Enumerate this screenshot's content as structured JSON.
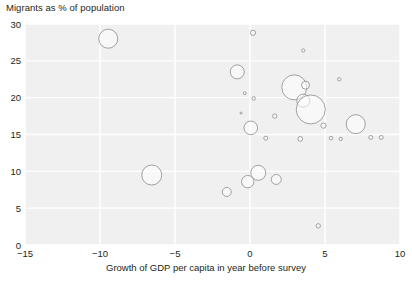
{
  "chart_data": {
    "type": "scatter",
    "title": "Migrants as % of population",
    "xlabel": "Growth of GDP per capita in year before survey",
    "ylabel": "Migrants as % of population",
    "xlim": [
      -15,
      10
    ],
    "ylim": [
      0,
      30
    ],
    "xticks": [
      "−15",
      "−10",
      "−5",
      "0",
      "5",
      "10"
    ],
    "xtick_values": [
      -15,
      -10,
      -5,
      0,
      5,
      10
    ],
    "yticks": [
      "0",
      "5",
      "10",
      "15",
      "20",
      "25",
      "30"
    ],
    "ytick_values": [
      0,
      5,
      10,
      15,
      20,
      25,
      30
    ],
    "grid": true,
    "grid_color": "#ffffff",
    "plot_background": "#f0f0f0",
    "marker_style": "open-circle",
    "marker_stroke": "#8c8c8c",
    "marker_fill": "#ffffff",
    "legend": "none",
    "size_encodes": "population",
    "points": [
      {
        "x": -9.45,
        "y": 28.0,
        "r": 9.5
      },
      {
        "x": 0.2,
        "y": 28.8,
        "r": 2.6
      },
      {
        "x": 3.55,
        "y": 26.4,
        "r": 1.6
      },
      {
        "x": -0.85,
        "y": 23.5,
        "r": 7.0
      },
      {
        "x": 2.95,
        "y": 21.4,
        "r": 12.5
      },
      {
        "x": 3.7,
        "y": 21.7,
        "r": 4.0
      },
      {
        "x": 5.95,
        "y": 22.5,
        "r": 1.7
      },
      {
        "x": 3.55,
        "y": 19.6,
        "r": 6.5
      },
      {
        "x": 4.05,
        "y": 18.4,
        "r": 14.5
      },
      {
        "x": 0.25,
        "y": 19.9,
        "r": 1.7
      },
      {
        "x": -0.35,
        "y": 20.6,
        "r": 1.4
      },
      {
        "x": 1.65,
        "y": 17.5,
        "r": 2.2
      },
      {
        "x": -0.6,
        "y": 17.9,
        "r": 1.0
      },
      {
        "x": 0.05,
        "y": 15.9,
        "r": 6.8
      },
      {
        "x": 7.05,
        "y": 16.4,
        "r": 9.5
      },
      {
        "x": 4.9,
        "y": 16.2,
        "r": 2.6
      },
      {
        "x": 8.05,
        "y": 14.6,
        "r": 2.0
      },
      {
        "x": 8.75,
        "y": 14.6,
        "r": 2.0
      },
      {
        "x": 1.05,
        "y": 14.5,
        "r": 2.0
      },
      {
        "x": 3.35,
        "y": 14.4,
        "r": 2.4
      },
      {
        "x": 5.4,
        "y": 14.5,
        "r": 1.8
      },
      {
        "x": 6.05,
        "y": 14.4,
        "r": 1.7
      },
      {
        "x": -6.55,
        "y": 9.5,
        "r": 10.0
      },
      {
        "x": 0.55,
        "y": 9.8,
        "r": 7.5
      },
      {
        "x": -0.15,
        "y": 8.6,
        "r": 6.2
      },
      {
        "x": 1.75,
        "y": 8.9,
        "r": 5.0
      },
      {
        "x": -1.55,
        "y": 7.2,
        "r": 4.5
      },
      {
        "x": 4.55,
        "y": 2.6,
        "r": 2.2
      }
    ]
  }
}
